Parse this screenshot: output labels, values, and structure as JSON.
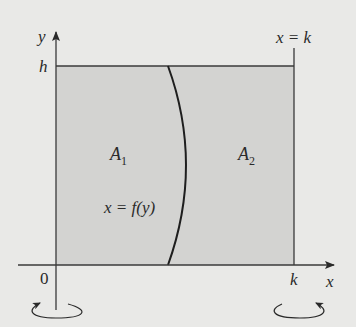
{
  "figure": {
    "axes": {
      "x_label": "x",
      "y_label": "y",
      "origin_label": "0",
      "h_label": "h",
      "k_label": "k"
    },
    "line_label": "x = k",
    "curve_label": "x = f(y)",
    "regions": [
      {
        "name": "A",
        "sub": "1"
      },
      {
        "name": "A",
        "sub": "2"
      }
    ],
    "colors": {
      "background": "#e9e9e7",
      "shade": "#d3d3d1",
      "ink": "#2a2a2a"
    }
  }
}
